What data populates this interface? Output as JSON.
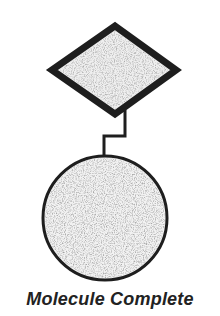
{
  "diagram": {
    "caption": "Molecule Complete",
    "shapes": [
      {
        "type": "diamond",
        "name": "diamond-node",
        "fill": "#ececec",
        "stroke": "#1e1e1e"
      },
      {
        "type": "circle",
        "name": "circle-node",
        "fill": "#eeeeee",
        "stroke": "#1e1e1e"
      }
    ],
    "connector": {
      "style": "orthogonal-step",
      "stroke": "#1e1e1e"
    }
  }
}
